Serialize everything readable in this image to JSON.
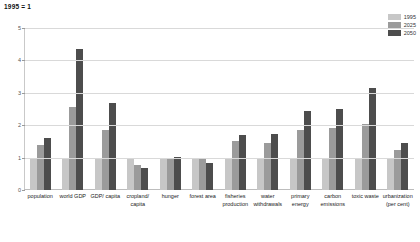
{
  "chart_data": {
    "type": "bar",
    "title": "1995 = 1",
    "xlabel": "",
    "ylabel": "",
    "ylim": [
      0,
      5
    ],
    "yticks": [
      0,
      1,
      2,
      3,
      4,
      5
    ],
    "grid": true,
    "legend_position": "top-right",
    "categories": [
      "population",
      "world GDP",
      "GDP/ capita",
      "cropland/ capita",
      "hunger",
      "forest area",
      "fisheries production",
      "water withdrawals",
      "primary energy",
      "carbon emissions",
      "toxic waste",
      "urbanization (per cent)"
    ],
    "series": [
      {
        "name": "1995",
        "color": "#c7c7c7",
        "values": [
          1.0,
          1.0,
          1.0,
          1.0,
          1.0,
          1.0,
          1.0,
          1.0,
          1.0,
          1.0,
          1.0,
          1.0
        ]
      },
      {
        "name": "2025",
        "color": "#9b9b9b",
        "values": [
          1.4,
          2.55,
          1.85,
          0.78,
          1.0,
          0.95,
          1.5,
          1.45,
          1.85,
          1.9,
          2.05,
          1.25
        ]
      },
      {
        "name": "2050",
        "color": "#4d4d4d",
        "values": [
          1.6,
          4.35,
          2.7,
          0.68,
          1.02,
          0.82,
          1.7,
          1.72,
          2.45,
          2.5,
          3.15,
          1.45
        ]
      }
    ]
  },
  "legend": {
    "items": [
      {
        "label": "1995",
        "color": "#c7c7c7"
      },
      {
        "label": "2025",
        "color": "#9b9b9b"
      },
      {
        "label": "2050",
        "color": "#4d4d4d"
      }
    ]
  }
}
